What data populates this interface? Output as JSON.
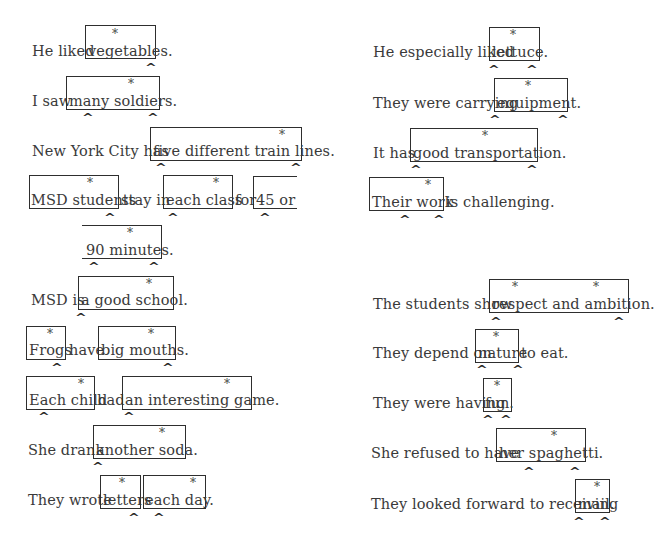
{
  "left": {
    "s1": {
      "pre": "He liked",
      "box1": "vegetables."
    },
    "s2": {
      "pre": "I saw",
      "box1": "many soldiers."
    },
    "s3": {
      "pre": "New York City has",
      "box1": "five different train lines."
    },
    "s4": {
      "box1": "MSD students",
      "mid1": "stay in",
      "box2": "each class",
      "mid2": "for",
      "box3": "45 or"
    },
    "s5": {
      "box1": "90 minutes."
    },
    "s6": {
      "pre": "MSD is",
      "box1": "a good school."
    },
    "s7": {
      "box1": "Frogs",
      "mid1": "have",
      "box2": "big mouths."
    },
    "s8": {
      "box1": "Each child",
      "mid1": "had",
      "box2": "an interesting game."
    },
    "s9": {
      "pre": "She drank",
      "box1": "another soda."
    },
    "s10": {
      "pre": "They wrote",
      "box1": "letters",
      "box2": "each day."
    }
  },
  "right": {
    "s1": {
      "pre": "He especially liked",
      "box1": "lettuce."
    },
    "s2": {
      "pre": "They were carrying",
      "box1": "equipment."
    },
    "s3": {
      "pre": "It has",
      "box1": "good transportation."
    },
    "s4": {
      "box1": "Their work",
      "post": "is challenging."
    },
    "s5": {
      "pre": "The students show",
      "box1": "respect and ambition."
    },
    "s6": {
      "pre": "They depend on",
      "box1": "nature",
      "post": "to eat."
    },
    "s7": {
      "pre": "They were having",
      "box1": "fun."
    },
    "s8": {
      "pre": "She refused to have",
      "box1": "her spaghetti."
    },
    "s9": {
      "pre": "They looked forward to receiving",
      "box1": "mail."
    }
  },
  "marks": {
    "head": "*",
    "boundary": "^"
  }
}
